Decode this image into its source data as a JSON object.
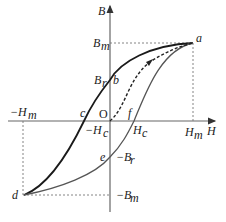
{
  "diagram": {
    "axes": {
      "x_label": "H",
      "y_label": "B",
      "origin_label": "O"
    },
    "levels": {
      "Bm": "B",
      "Bm_sub": "m",
      "Br": "B",
      "Br_sub": "r",
      "neg_Br": "−B",
      "neg_Br_sub": "r",
      "neg_Bm": "−B",
      "neg_Bm_sub": "m",
      "Hm": "H",
      "Hm_sub": "m",
      "neg_Hm": "−H",
      "neg_Hm_sub": "m",
      "Hc": "H",
      "Hc_sub": "c",
      "neg_Hc": "−H",
      "neg_Hc_sub": "c"
    },
    "points": {
      "a": "a",
      "b": "b",
      "c": "c",
      "d": "d",
      "e": "e",
      "f": "f"
    },
    "colors": {
      "upper_branch": "#1a1a1a",
      "lower_branch": "#555555",
      "initial_curve": "#222222",
      "axes": "#555555",
      "guides": "#777777"
    }
  }
}
